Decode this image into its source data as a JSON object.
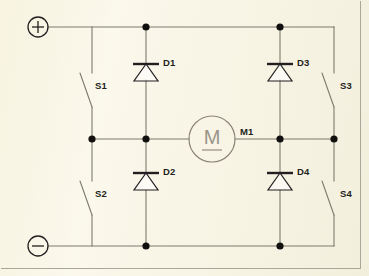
{
  "diagram": {
    "type": "schematic",
    "background_color": "#f7f3e3",
    "line_color": "#7d7a6e",
    "ink_color": "#231f20",
    "frame_color": "#a9a79a"
  },
  "terminals": [
    {
      "id": "positive",
      "label": "+",
      "symbol": "plus-in-circle",
      "x": 38,
      "y": 27
    },
    {
      "id": "negative",
      "label": "–",
      "symbol": "minus-in-circle",
      "x": 38,
      "y": 246
    }
  ],
  "switches": [
    {
      "id": "S1",
      "label": "S1",
      "state": "open",
      "label_x": 95,
      "label_y": 86
    },
    {
      "id": "S2",
      "label": "S2",
      "state": "open",
      "label_x": 95,
      "label_y": 194
    },
    {
      "id": "S3",
      "label": "S3",
      "state": "open",
      "label_x": 342,
      "label_y": 86
    },
    {
      "id": "S4",
      "label": "S4",
      "state": "open",
      "label_x": 342,
      "label_y": 194
    }
  ],
  "diodes": [
    {
      "id": "D1",
      "label": "D1",
      "orientation": "cathode-up",
      "label_x": 161,
      "label_y": 63
    },
    {
      "id": "D2",
      "label": "D2",
      "orientation": "cathode-up",
      "label_x": 161,
      "label_y": 173
    },
    {
      "id": "D3",
      "label": "D3",
      "orientation": "cathode-up",
      "label_x": 295,
      "label_y": 63
    },
    {
      "id": "D4",
      "label": "D4",
      "orientation": "cathode-up",
      "label_x": 295,
      "label_y": 173
    }
  ],
  "motor": {
    "id": "M1",
    "label": "M1",
    "symbol": "M",
    "center_x": 212,
    "center_y": 139,
    "radius": 23,
    "label_x": 242,
    "label_y": 132
  },
  "rails": {
    "top_label": "positive rail",
    "middle_label": "motor rail",
    "bottom_label": "negative rail"
  },
  "junction_dots": [
    {
      "x": 146,
      "y": 27
    },
    {
      "x": 280,
      "y": 27
    },
    {
      "x": 92,
      "y": 139
    },
    {
      "x": 146,
      "y": 139
    },
    {
      "x": 280,
      "y": 139
    },
    {
      "x": 334,
      "y": 139
    },
    {
      "x": 146,
      "y": 246
    },
    {
      "x": 280,
      "y": 246
    }
  ]
}
